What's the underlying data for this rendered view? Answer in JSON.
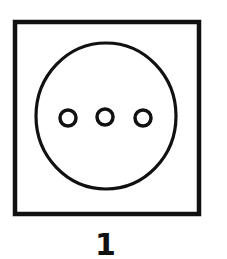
{
  "figure": {
    "label": "1",
    "colors": {
      "stroke": "#111111",
      "background": "#ffffff"
    },
    "plate": {
      "x": 15,
      "y": 22,
      "width": 184,
      "height": 192,
      "stroke_width": 4.5
    },
    "face": {
      "cx": 106,
      "cy": 116,
      "rx": 70,
      "ry": 73,
      "stroke_width": 3.2
    },
    "holes": [
      {
        "cx": 68,
        "cy": 118,
        "r": 8,
        "stroke_width": 3.5
      },
      {
        "cx": 105,
        "cy": 117,
        "r": 8,
        "stroke_width": 3.5
      },
      {
        "cx": 143,
        "cy": 118,
        "r": 8,
        "stroke_width": 3.5
      }
    ]
  }
}
